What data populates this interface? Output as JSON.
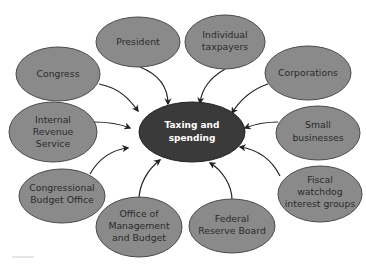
{
  "diagram": {
    "type": "hub-and-spoke",
    "center": {
      "label_lines": [
        "Taxing and",
        "spending"
      ],
      "fill": "#3a3a3a",
      "text_color": "#ffffff"
    },
    "node_fill": "#8a8a8a",
    "node_stroke": "#4a4a4a",
    "arrow_color": "#222222",
    "nodes": [
      {
        "id": "president",
        "label_lines": [
          "President"
        ]
      },
      {
        "id": "individual-taxpayers",
        "label_lines": [
          "Individual",
          "taxpayers"
        ]
      },
      {
        "id": "congress",
        "label_lines": [
          "Congress"
        ]
      },
      {
        "id": "corporations",
        "label_lines": [
          "Corporations"
        ]
      },
      {
        "id": "internal-revenue-service",
        "label_lines": [
          "Internal",
          "Revenue",
          "Service"
        ]
      },
      {
        "id": "small-businesses",
        "label_lines": [
          "Small",
          "businesses"
        ]
      },
      {
        "id": "congressional-budget-office",
        "label_lines": [
          "Congressional",
          "Budget Office"
        ]
      },
      {
        "id": "fiscal-watchdog-interest-groups",
        "label_lines": [
          "Fiscal",
          "watchdog",
          "interest groups"
        ]
      },
      {
        "id": "office-of-management-and-budget",
        "label_lines": [
          "Office of",
          "Management",
          "and Budget"
        ]
      },
      {
        "id": "federal-reserve-board",
        "label_lines": [
          "Federal",
          "Reserve Board"
        ]
      }
    ],
    "edges_direction": "all nodes point to center"
  }
}
